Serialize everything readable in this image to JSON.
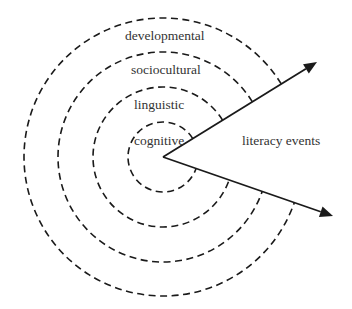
{
  "diagram": {
    "center": {
      "x": 163,
      "y": 157
    },
    "rings": [
      {
        "name": "cognitive",
        "label": "cognitive",
        "radius": 35,
        "label_x": 134,
        "label_y": 145
      },
      {
        "name": "linguistic",
        "label": "linguistic",
        "radius": 70,
        "label_x": 134,
        "label_y": 109
      },
      {
        "name": "sociocultural",
        "label": "sociocultural",
        "radius": 105,
        "label_x": 131,
        "label_y": 74
      },
      {
        "name": "developmental",
        "label": "developmental",
        "radius": 139,
        "label_x": 125,
        "label_y": 40
      }
    ],
    "arrows": [
      {
        "name": "upper-arrow",
        "tip_x": 317,
        "tip_y": 62
      },
      {
        "name": "lower-arrow",
        "tip_x": 333,
        "tip_y": 216
      }
    ],
    "wedge_label": {
      "text": "literacy events",
      "x": 242,
      "y": 145
    },
    "colors": {
      "stroke": "#1a1a1a",
      "text": "#333333",
      "background": "#ffffff"
    }
  }
}
